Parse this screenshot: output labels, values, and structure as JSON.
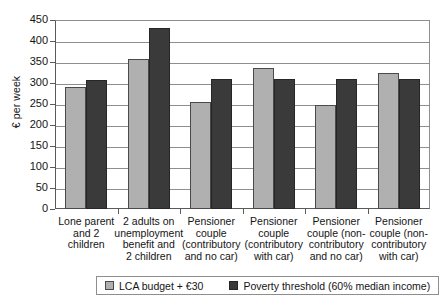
{
  "chart_data": {
    "type": "bar",
    "title": "",
    "subtitle": "",
    "xlabel": "",
    "ylabel": "€ per week",
    "ylim": [
      0,
      450
    ],
    "ytick_step": 50,
    "yticks": [
      450,
      400,
      350,
      300,
      250,
      200,
      150,
      100,
      50,
      0
    ],
    "grid": true,
    "legend_position": "bottom",
    "categories": [
      "Lone parent and 2 children",
      "2 adults on unemployment benefit and 2 children",
      "Pensioner couple (contributory and no car)",
      "Pensioner couple (contributory with car)",
      "Pensioner couple (non-contributory and no car)",
      "Pensioner couple (non-contributory with car)"
    ],
    "category_lines": [
      [
        "Lone parent",
        "and 2",
        "children"
      ],
      [
        "2 adults on",
        "unemployment",
        "benefit and",
        "2 children"
      ],
      [
        "Pensioner",
        "couple",
        "(contributory",
        "and no car)"
      ],
      [
        "Pensioner",
        "couple",
        "(contributory",
        "with car)"
      ],
      [
        "Pensioner",
        "couple (non-",
        "contributory",
        "and no car)"
      ],
      [
        "Pensioner",
        "couple (non-",
        "contributory",
        "with car)"
      ]
    ],
    "series": [
      {
        "name": "LCA budget + €30",
        "color": "#b0b0b0",
        "values": [
          290,
          357,
          255,
          335,
          247,
          325
        ]
      },
      {
        "name": "Poverty threshold (60% median income)",
        "color": "#3a3a3a",
        "values": [
          308,
          432,
          310,
          310,
          310,
          310
        ]
      }
    ]
  },
  "legend": {
    "items": [
      {
        "label": "LCA budget + €30"
      },
      {
        "label": "Poverty threshold (60% median income)"
      }
    ]
  }
}
